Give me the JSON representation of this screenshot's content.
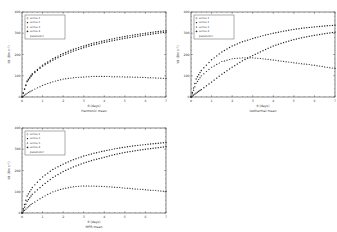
{
  "chart_data": [
    {
      "type": "line",
      "title": "",
      "subtitle": "Harmonic mean",
      "xlabel": "θ (days)",
      "ylabel": "Vd (Bm s⁻¹)",
      "xlim": [
        0,
        7
      ],
      "ylim": [
        0,
        400
      ],
      "xticks": [
        0,
        1,
        2,
        3,
        4,
        5,
        6,
        7
      ],
      "yticks": [
        0,
        100,
        200,
        300,
        400
      ],
      "grid": false,
      "legend_position": "upper left",
      "legend": [
        "series 1",
        "series 2",
        "series 3",
        "series 4",
        "parameter"
      ],
      "x": [
        0,
        0.25,
        0.5,
        1,
        1.5,
        2,
        2.5,
        3,
        3.5,
        4,
        4.5,
        5,
        5.5,
        6,
        6.5,
        7
      ],
      "series": [
        {
          "name": "series 1",
          "values": [
            0,
            75,
            110,
            150,
            180,
            205,
            225,
            240,
            254,
            265,
            276,
            285,
            293,
            300,
            307,
            312
          ]
        },
        {
          "name": "series 2",
          "values": [
            0,
            72,
            105,
            145,
            173,
            197,
            216,
            232,
            246,
            257,
            267,
            276,
            284,
            292,
            299,
            305
          ]
        },
        {
          "name": "series 3",
          "values": [
            0,
            18,
            32,
            55,
            72,
            85,
            91,
            95,
            97,
            97,
            96,
            95,
            94,
            92,
            90,
            88
          ]
        }
      ]
    },
    {
      "type": "line",
      "title": "",
      "subtitle": "Isothermal mean",
      "xlabel": "θ (days)",
      "ylabel": "Vd (Bm s⁻¹)",
      "xlim": [
        0,
        7
      ],
      "ylim": [
        0,
        400
      ],
      "xticks": [
        0,
        1,
        2,
        3,
        4,
        5,
        6,
        7
      ],
      "yticks": [
        0,
        100,
        200,
        300,
        400
      ],
      "grid": false,
      "legend_position": "upper left",
      "legend": [
        "series 1",
        "series 2",
        "series 3",
        "series 4",
        "parameter"
      ],
      "x": [
        0,
        0.25,
        0.5,
        1,
        1.5,
        2,
        2.5,
        3,
        3.5,
        4,
        4.5,
        5,
        5.5,
        6,
        6.5,
        7
      ],
      "series": [
        {
          "name": "series 1",
          "values": [
            0,
            85,
            125,
            175,
            212,
            240,
            260,
            275,
            289,
            300,
            310,
            318,
            325,
            330,
            334,
            338
          ]
        },
        {
          "name": "series 2",
          "values": [
            0,
            18,
            35,
            70,
            107,
            140,
            170,
            195,
            218,
            240,
            256,
            270,
            281,
            290,
            298,
            305
          ]
        },
        {
          "name": "series 3",
          "values": [
            0,
            65,
            100,
            140,
            167,
            180,
            185,
            185,
            180,
            175,
            168,
            162,
            156,
            150,
            142,
            135
          ]
        }
      ]
    },
    {
      "type": "line",
      "title": "",
      "subtitle": "MPR mean",
      "xlabel": "θ (days)",
      "ylabel": "Vd (Bm s⁻¹)",
      "xlim": [
        0,
        7
      ],
      "ylim": [
        0,
        400
      ],
      "xticks": [
        0,
        1,
        2,
        3,
        4,
        5,
        6,
        7
      ],
      "yticks": [
        0,
        100,
        200,
        300,
        400
      ],
      "grid": false,
      "legend_position": "upper left",
      "legend": [
        "series 1",
        "series 2",
        "series 3",
        "series 4",
        "parameter"
      ],
      "x": [
        0,
        0.25,
        0.5,
        1,
        1.5,
        2,
        2.5,
        3,
        3.5,
        4,
        4.5,
        5,
        5.5,
        6,
        6.5,
        7
      ],
      "series": [
        {
          "name": "series 1",
          "values": [
            0,
            80,
            120,
            170,
            205,
            230,
            251,
            268,
            281,
            292,
            302,
            310,
            317,
            322,
            327,
            332
          ]
        },
        {
          "name": "series 2",
          "values": [
            0,
            55,
            88,
            130,
            167,
            195,
            217,
            235,
            250,
            262,
            275,
            285,
            293,
            300,
            306,
            312
          ]
        },
        {
          "name": "series 3",
          "values": [
            0,
            25,
            45,
            75,
            100,
            115,
            124,
            128,
            127,
            125,
            122,
            118,
            114,
            110,
            106,
            102
          ]
        }
      ]
    }
  ]
}
